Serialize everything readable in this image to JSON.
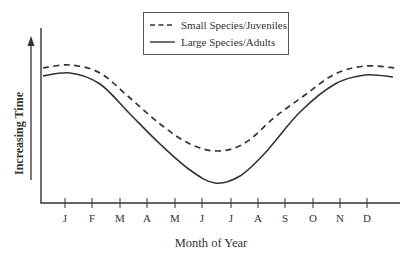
{
  "chart_data": {
    "type": "line",
    "title": "",
    "xlabel": "Month of Year",
    "ylabel": "Increasing Time",
    "categories": [
      "J",
      "F",
      "M",
      "A",
      "M",
      "J",
      "J",
      "A",
      "S",
      "O",
      "N",
      "D"
    ],
    "legend": {
      "position": "top-center",
      "entries": [
        {
          "label": "Small Species/Juveniles",
          "style": "dashed"
        },
        {
          "label": "Large Species/Adults",
          "style": "solid"
        }
      ]
    },
    "grid": false,
    "y_ticks": false,
    "series": [
      {
        "name": "Small Species/Juveniles",
        "style": "dashed",
        "values_relative": [
          0.92,
          0.9,
          0.78,
          0.62,
          0.45,
          0.35,
          0.35,
          0.47,
          0.64,
          0.84,
          0.93,
          0.94
        ],
        "points_px": [
          [
            43,
            68
          ],
          [
            70,
            65
          ],
          [
            100,
            73
          ],
          [
            130,
            98
          ],
          [
            160,
            124
          ],
          [
            190,
            144
          ],
          [
            218,
            151
          ],
          [
            245,
            143
          ],
          [
            275,
            117
          ],
          [
            305,
            95
          ],
          [
            335,
            74
          ],
          [
            365,
            66
          ],
          [
            396,
            68
          ]
        ]
      },
      {
        "name": "Large Species/Adults",
        "style": "solid",
        "values_relative": [
          0.88,
          0.85,
          0.7,
          0.48,
          0.25,
          0.12,
          0.13,
          0.3,
          0.54,
          0.76,
          0.86,
          0.87
        ],
        "points_px": [
          [
            43,
            76
          ],
          [
            70,
            73
          ],
          [
            100,
            84
          ],
          [
            130,
            114
          ],
          [
            160,
            144
          ],
          [
            190,
            170
          ],
          [
            215,
            183
          ],
          [
            240,
            176
          ],
          [
            265,
            153
          ],
          [
            300,
            112
          ],
          [
            335,
            84
          ],
          [
            365,
            75
          ],
          [
            393,
            77
          ]
        ]
      }
    ]
  },
  "ui": {
    "x_tick_px": [
      65,
      92,
      120,
      147,
      175,
      202,
      231,
      258,
      285,
      313,
      340,
      367
    ]
  }
}
